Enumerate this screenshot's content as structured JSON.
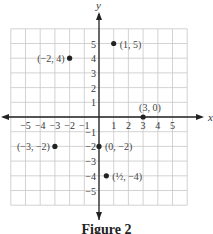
{
  "figure": {
    "caption": "Figure 2",
    "x_axis_label": "x",
    "y_axis_label": "y",
    "x_ticks": [
      "−5",
      "−4",
      "−3",
      "−2",
      "−1",
      "1",
      "2",
      "3",
      "4",
      "5"
    ],
    "y_ticks": [
      "5",
      "4",
      "3",
      "2",
      "1",
      "−1",
      "−2",
      "−3",
      "−4",
      "−5"
    ],
    "grid_range": {
      "x": [
        -6,
        6
      ],
      "y": [
        -6,
        6
      ]
    },
    "colors": {
      "grid": "#c8c8c8",
      "axis": "#222222",
      "point": "#222222",
      "label": "#444444"
    }
  },
  "chart_data": {
    "type": "scatter",
    "title": "Figure 2",
    "xlabel": "x",
    "ylabel": "y",
    "xlim": [
      -6,
      6
    ],
    "ylim": [
      -6,
      6
    ],
    "grid": true,
    "points": [
      {
        "x": 1,
        "y": 5,
        "label": "(1, 5)"
      },
      {
        "x": -2,
        "y": 4,
        "label": "(−2, 4)"
      },
      {
        "x": 3,
        "y": 0,
        "label": "(3, 0)"
      },
      {
        "x": -3,
        "y": -2,
        "label": "(−3, −2)"
      },
      {
        "x": 0,
        "y": -2,
        "label": "(0, −2)"
      },
      {
        "x": 0.5,
        "y": -4,
        "label": "(1/2, −4)"
      }
    ]
  }
}
